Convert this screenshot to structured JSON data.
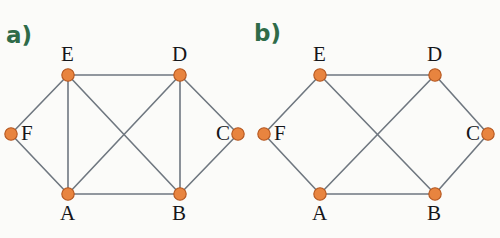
{
  "figure": {
    "width": 500,
    "height": 238,
    "background_color": "#fbfbf9",
    "node_fill_color": "#e8843f",
    "node_stroke_color": "#b4561f",
    "edge_color": "#6f7780",
    "panel_label_color": "#2f6b49",
    "node_label_color": "#15161a"
  },
  "panels": [
    {
      "id": "panel-a",
      "label": "a)",
      "label_x": 6,
      "label_y": 22,
      "nodes": [
        {
          "id": "E",
          "label": "E",
          "x": 68,
          "y": 75,
          "label_x": 61,
          "label_y": 44
        },
        {
          "id": "D",
          "label": "D",
          "x": 180,
          "y": 75,
          "label_x": 172,
          "label_y": 44
        },
        {
          "id": "F",
          "label": "F",
          "x": 11,
          "y": 134,
          "label_x": 21,
          "label_y": 123
        },
        {
          "id": "C",
          "label": "C",
          "x": 238,
          "y": 134,
          "label_x": 216,
          "label_y": 123
        },
        {
          "id": "A",
          "label": "A",
          "x": 68,
          "y": 194,
          "label_x": 60,
          "label_y": 203
        },
        {
          "id": "B",
          "label": "B",
          "x": 180,
          "y": 194,
          "label_x": 172,
          "label_y": 203
        }
      ],
      "edges": [
        {
          "from": "E",
          "to": "D"
        },
        {
          "from": "E",
          "to": "F"
        },
        {
          "from": "F",
          "to": "A"
        },
        {
          "from": "E",
          "to": "A"
        },
        {
          "from": "A",
          "to": "B"
        },
        {
          "from": "D",
          "to": "B"
        },
        {
          "from": "D",
          "to": "C"
        },
        {
          "from": "C",
          "to": "B"
        },
        {
          "from": "E",
          "to": "B"
        },
        {
          "from": "D",
          "to": "A"
        }
      ]
    },
    {
      "id": "panel-b",
      "label": "b)",
      "label_x": 254,
      "label_y": 20,
      "nodes": [
        {
          "id": "E",
          "label": "E",
          "x": 320,
          "y": 75,
          "label_x": 313,
          "label_y": 44
        },
        {
          "id": "D",
          "label": "D",
          "x": 435,
          "y": 75,
          "label_x": 427,
          "label_y": 44
        },
        {
          "id": "F",
          "label": "F",
          "x": 264,
          "y": 134,
          "label_x": 274,
          "label_y": 123
        },
        {
          "id": "C",
          "label": "C",
          "x": 488,
          "y": 134,
          "label_x": 466,
          "label_y": 123
        },
        {
          "id": "A",
          "label": "A",
          "x": 320,
          "y": 194,
          "label_x": 312,
          "label_y": 203
        },
        {
          "id": "B",
          "label": "B",
          "x": 435,
          "y": 194,
          "label_x": 427,
          "label_y": 203
        }
      ],
      "edges": [
        {
          "from": "E",
          "to": "D"
        },
        {
          "from": "E",
          "to": "F"
        },
        {
          "from": "F",
          "to": "A"
        },
        {
          "from": "A",
          "to": "B"
        },
        {
          "from": "D",
          "to": "C"
        },
        {
          "from": "C",
          "to": "B"
        },
        {
          "from": "E",
          "to": "B"
        },
        {
          "from": "D",
          "to": "A"
        }
      ]
    }
  ]
}
